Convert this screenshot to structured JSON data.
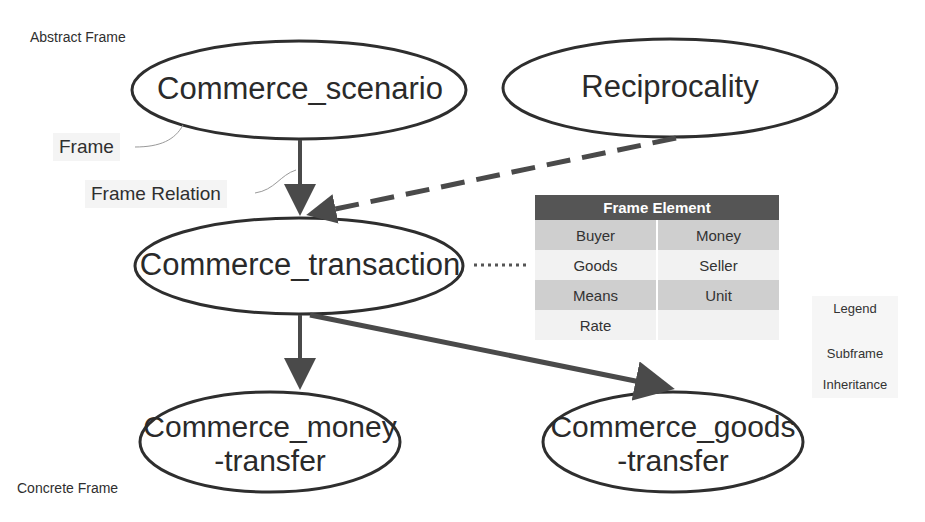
{
  "labels": {
    "abstract_frame": "Abstract Frame",
    "concrete_frame": "Concrete Frame",
    "frame_callout": "Frame",
    "frame_relation_callout": "Frame Relation"
  },
  "nodes": {
    "commerce_scenario": "Commerce_scenario",
    "reciprocality": "Reciprocality",
    "commerce_transaction": "Commerce_transaction",
    "commerce_money_transfer_line1": "Commerce_money",
    "commerce_money_transfer_line2": "-transfer",
    "commerce_goods_transfer_line1": "Commerce_goods",
    "commerce_goods_transfer_line2": "-transfer"
  },
  "edges": [
    {
      "from": "Commerce_scenario",
      "to": "Commerce_transaction",
      "type": "Subframe"
    },
    {
      "from": "Reciprocality",
      "to": "Commerce_transaction",
      "type": "Inheritance"
    },
    {
      "from": "Commerce_transaction",
      "to": "Commerce_money-transfer",
      "type": "Subframe"
    },
    {
      "from": "Commerce_transaction",
      "to": "Commerce_goods-transfer",
      "type": "Subframe"
    },
    {
      "from": "Commerce_transaction",
      "to": "Frame Element table",
      "type": "dotted"
    }
  ],
  "frame_element_table": {
    "header": "Frame Element",
    "rows": [
      [
        "Buyer",
        "Money"
      ],
      [
        "Goods",
        "Seller"
      ],
      [
        "Means",
        "Unit"
      ],
      [
        "Rate",
        ""
      ]
    ]
  },
  "legend": {
    "title": "Legend",
    "subframe": "Subframe",
    "inheritance": "Inheritance"
  },
  "colors": {
    "stroke": "#2e2e2e",
    "arrow": "#4a4a4a",
    "table_header": "#555555",
    "table_dark_row": "#cfcfcf",
    "table_light_row": "#f2f2f2"
  }
}
